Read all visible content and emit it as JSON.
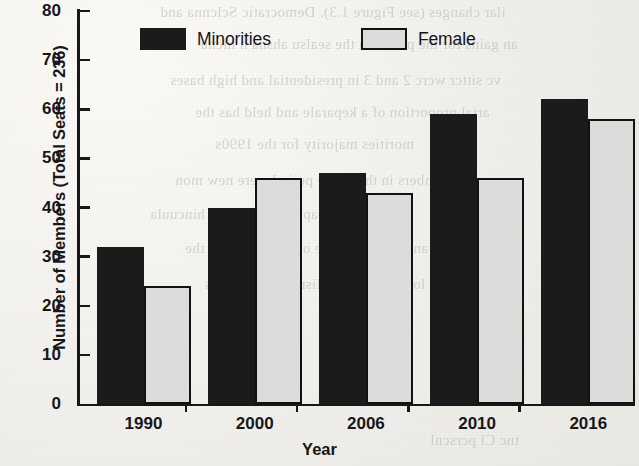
{
  "chart_data": {
    "type": "bar",
    "title": "",
    "xlabel": "Year",
    "ylabel": "Number of Members (Total Seats = 236)",
    "categories": [
      "1990",
      "2000",
      "2006",
      "2010",
      "2016"
    ],
    "series": [
      {
        "name": "Minorities",
        "values": [
          32,
          40,
          47,
          59,
          62
        ],
        "color": "#1b1b1b"
      },
      {
        "name": "Female",
        "values": [
          24,
          46,
          43,
          46,
          58
        ],
        "color": "#dcdcda"
      }
    ],
    "ylim": [
      0,
      80
    ],
    "yticks": [
      0,
      10,
      20,
      30,
      40,
      50,
      60,
      70,
      80
    ],
    "ytick_labels": [
      "0",
      "10",
      "20",
      "30",
      "40",
      "50",
      "60",
      "70",
      "80"
    ],
    "grid": false,
    "legend_position": "top-center"
  },
  "legend": {
    "entries": [
      {
        "label": "Minorities",
        "swatch": "filled-black-square"
      },
      {
        "label": "Female",
        "swatch": "outlined-gray-square"
      }
    ]
  },
  "background_ghost_text": [
    "ilar changes (see Figure 1.3). Democratic Sclcnna and",
    "an gains for the prcsnl in the sealsu ahsna h nlcnu",
    "vc sittcr wcrc 2 and 3 in presidential and high bases",
    "arial proportion of a keparale and held has the",
    "morities majority for the 1990s",
    "ncw members in this same period were new mon",
    "rtics, this leapt in the ovcr to hincuula",
    "bers and continued the overall siring in the",
    "wn lo share of vcry lisnc the mcmbers",
    "tnc Cl pcrscnl"
  ]
}
